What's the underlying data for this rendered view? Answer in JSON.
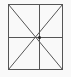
{
  "diagram": {
    "shape": "square-with-center-cross-and-diagonals",
    "colors": {
      "background": "#f9f9f9",
      "line": "#555555",
      "center_dot": "#222222"
    },
    "square": {
      "x": 8.5,
      "y": 4.5,
      "width": 54,
      "height": 65
    },
    "center": {
      "x": 39.5,
      "y": 37.5
    }
  }
}
